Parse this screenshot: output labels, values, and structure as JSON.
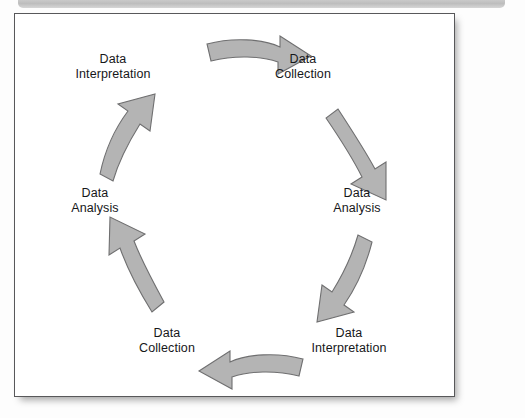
{
  "figure": {
    "type": "cycle-diagram",
    "title": "",
    "background_color": "#ffffff",
    "border_color": "#58585a",
    "arrow_fill_color": "#b4b4b4",
    "arrow_stroke_color": "#6f6f70",
    "top_bar_color": "#c9c9c9",
    "text_color": "#16171a",
    "nodes": [
      {
        "id": "node-0",
        "label": "Data\nInterpretation",
        "position": "top-left"
      },
      {
        "id": "node-1",
        "label": "Data\nCollection",
        "position": "top-right"
      },
      {
        "id": "node-2",
        "label": "Data\nAnalysis",
        "position": "right"
      },
      {
        "id": "node-3",
        "label": "Data\nInterpretation",
        "position": "bottom-right"
      },
      {
        "id": "node-4",
        "label": "Data\nCollection",
        "position": "bottom-left"
      },
      {
        "id": "node-5",
        "label": "Data\nAnalysis",
        "position": "left"
      }
    ],
    "arrows": [
      {
        "id": "arrow-0",
        "from": "node-0",
        "to": "node-1",
        "direction": "right",
        "name": "arrow-top-right"
      },
      {
        "id": "arrow-1",
        "from": "node-1",
        "to": "node-2",
        "direction": "down-right",
        "name": "arrow-down-right"
      },
      {
        "id": "arrow-2",
        "from": "node-2",
        "to": "node-3",
        "direction": "down-left",
        "name": "arrow-down-left"
      },
      {
        "id": "arrow-3",
        "from": "node-3",
        "to": "node-4",
        "direction": "left",
        "name": "arrow-bottom-left"
      },
      {
        "id": "arrow-4",
        "from": "node-4",
        "to": "node-5",
        "direction": "up-left",
        "name": "arrow-up-left"
      },
      {
        "id": "arrow-5",
        "from": "node-5",
        "to": "node-0",
        "direction": "up-right",
        "name": "arrow-up-right"
      }
    ],
    "flow_direction": "clockwise"
  }
}
